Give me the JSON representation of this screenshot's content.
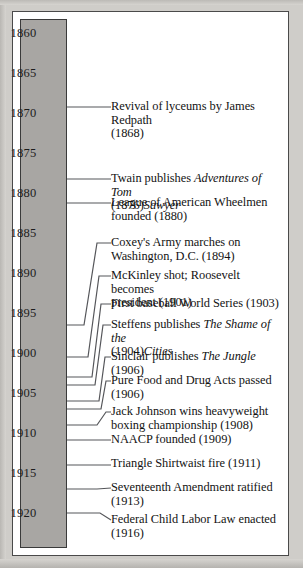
{
  "figure": {
    "type": "timeline",
    "orientation": "vertical",
    "axis_start_year": 1860,
    "axis_end_year": 1920,
    "axis_tick_interval": 5,
    "colors": {
      "axis_fill": "#a8a6a3",
      "axis_border": "#3a3a3a",
      "frame_border": "#4a4a4a",
      "paper": "#cfcdc9",
      "text": "#131313",
      "connector": "#55565a"
    }
  },
  "year_axis": {
    "labels": [
      "1860",
      "1865",
      "1870",
      "1875",
      "1880",
      "1885",
      "1890",
      "1895",
      "1900",
      "1905",
      "1910",
      "1915",
      "1920"
    ]
  },
  "events": [
    {
      "year": 1868,
      "text_html": "Revival of lyceums by James Redpath (1868)",
      "lines": [
        {
          "plain": "Revival of lyceums by James Redpath"
        },
        {
          "plain": "(1868)"
        }
      ]
    },
    {
      "year": 1876,
      "text_html": "Twain publishes <i>Adventures of Tom Sawyer</i> (1876)",
      "lines": [
        {
          "plain": "Twain publishes ",
          "italic": "Adventures of Tom"
        },
        {
          "italic": "Sawyer",
          "plain": " (1876)"
        }
      ]
    },
    {
      "year": 1880,
      "text_html": "League of American Wheelmen founded (1880)",
      "lines": [
        {
          "plain": "League of American Wheelmen"
        },
        {
          "plain": "founded (1880)"
        }
      ]
    },
    {
      "year": 1894,
      "text_html": "Coxey's Army marches on Washington, D.C. (1894)",
      "lines": [
        {
          "plain": "Coxey's Army marches on"
        },
        {
          "plain": "Washington, D.C. (1894)"
        }
      ]
    },
    {
      "year": 1901,
      "text_html": "McKinley shot; Roosevelt becomes president (1901)",
      "lines": [
        {
          "plain": "McKinley shot; Roosevelt becomes"
        },
        {
          "plain": "president (1901)"
        }
      ]
    },
    {
      "year": 1903,
      "text_html": "First baseball World Series (1903)",
      "lines": [
        {
          "plain": "First baseball World Series (1903)"
        }
      ]
    },
    {
      "year": 1904,
      "text_html": "Steffens publishes <i>The Shame of the Cities</i> (1904)",
      "lines": [
        {
          "plain": "Steffens publishes ",
          "italic": "The Shame of the"
        },
        {
          "italic": "Cities",
          "plain": " (1904)"
        }
      ]
    },
    {
      "year": 1906,
      "text_html": "Sinclair publishes <i>The Jungle</i> (1906)",
      "lines": [
        {
          "plain": "Sinclair publishes ",
          "italic": "The Jungle",
          "plain2": " (1906)"
        }
      ]
    },
    {
      "year": 1906,
      "text_html": "Pure Food and Drug Acts passed (1906)",
      "lines": [
        {
          "plain": "Pure Food and Drug Acts passed"
        },
        {
          "plain": "(1906)"
        }
      ]
    },
    {
      "year": 1908,
      "text_html": "Jack Johnson wins heavyweight boxing championship (1908)",
      "lines": [
        {
          "plain": "Jack Johnson wins heavyweight"
        },
        {
          "plain": "boxing championship (1908)"
        }
      ]
    },
    {
      "year": 1909,
      "text_html": "NAACP founded (1909)",
      "lines": [
        {
          "plain": "NAACP founded (1909)"
        }
      ]
    },
    {
      "year": 1911,
      "text_html": "Triangle Shirtwaist fire (1911)",
      "lines": [
        {
          "plain": "Triangle Shirtwaist fire (1911)"
        }
      ]
    },
    {
      "year": 1913,
      "text_html": "Seventeenth Amendment ratified (1913)",
      "lines": [
        {
          "plain": "Seventeenth Amendment ratified"
        },
        {
          "plain": "(1913)"
        }
      ]
    },
    {
      "year": 1916,
      "text_html": "Federal Child Labor Law enacted (1916)",
      "lines": [
        {
          "plain": "Federal Child Labor Law enacted"
        },
        {
          "plain": "(1916)"
        }
      ]
    }
  ],
  "layout": {
    "year_label_y": [
      33,
      73,
      113,
      153,
      193,
      233,
      273,
      313,
      353,
      393,
      433,
      473,
      513
    ],
    "event_text_y": [
      100,
      172,
      196,
      236,
      269,
      297,
      318,
      350,
      374,
      405,
      433,
      457,
      481,
      513
    ],
    "connector_paths": [
      "M67,107 L111,107",
      "M67,179 L111,179",
      "M67,203 L111,203",
      "M67,325 L84,325 L97,243 L111,243",
      "M67,357 L88,357 L99,276 L111,276",
      "M67,377 L92,377 L101,304 L111,304",
      "M67,385 L95,385 L103,325 L111,325",
      "M67,401 L99,401 L105,357 L111,357",
      "M67,409 L101,409 L106,381 L111,381",
      "M67,425 L97,425 L106,412 L111,412",
      "M67,440 L111,440",
      "M67,465 L111,465",
      "M67,489 L97,489 L111,488",
      "M67,513 L100,513 L111,520"
    ]
  }
}
